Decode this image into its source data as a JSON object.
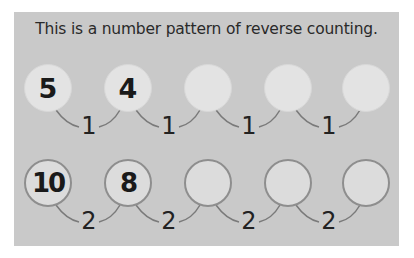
{
  "title": "This is a number pattern of reverse counting.",
  "rows": [
    {
      "circles": [
        "5",
        "4",
        "",
        "",
        ""
      ],
      "differences": [
        "1",
        "1",
        "1",
        "1"
      ]
    },
    {
      "circles": [
        "10",
        "8",
        "",
        "",
        ""
      ],
      "differences": [
        "2",
        "2",
        "2",
        "2"
      ]
    }
  ]
}
